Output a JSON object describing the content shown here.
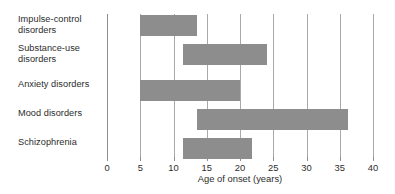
{
  "chart_data": {
    "type": "bar",
    "orientation": "horizontal",
    "subtype": "range-bar",
    "title": "",
    "xlabel": "Age of onset (years)",
    "ylabel": "",
    "xlim": [
      0,
      40
    ],
    "xticks": [
      0,
      5,
      10,
      15,
      20,
      25,
      30,
      35,
      40
    ],
    "xtick_labels": [
      "0",
      "5",
      "10",
      "15",
      "20",
      "25",
      "30",
      "35",
      "40"
    ],
    "grid": true,
    "legend": "none",
    "bar_color": "#8d8d8d",
    "categories": [
      "Impulse-control disorders",
      "Substance-use disorders",
      "Anxiety disorders",
      "Mood disorders",
      "Schizophrenia"
    ],
    "ranges": [
      {
        "category": "Impulse-control disorders",
        "start": 5.0,
        "end": 13.5
      },
      {
        "category": "Substance-use disorders",
        "start": 11.5,
        "end": 24.0
      },
      {
        "category": "Anxiety disorders",
        "start": 5.0,
        "end": 20.0
      },
      {
        "category": "Mood disorders",
        "start": 13.5,
        "end": 36.2
      },
      {
        "category": "Schizophrenia",
        "start": 11.4,
        "end": 21.8
      }
    ]
  },
  "labels": {
    "impulse": {
      "line1": "Impulse-control",
      "line2": "disorders"
    },
    "substance": {
      "line1": "Substance-use",
      "line2": "disorders"
    },
    "anxiety": {
      "line1": "Anxiety disorders"
    },
    "mood": {
      "line1": "Mood disorders"
    },
    "schizophrenia": {
      "line1": "Schizophrenia"
    }
  },
  "axis": {
    "title": "Age of onset (years)"
  }
}
